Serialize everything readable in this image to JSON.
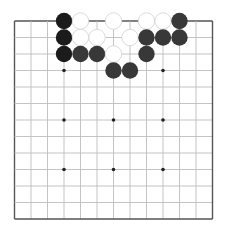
{
  "board": {
    "size": 13,
    "origin_x": 14.5,
    "origin_y": 21,
    "spacing": 16.5,
    "stone_radius": 8.2,
    "star_points": [
      [
        3,
        3
      ],
      [
        6,
        3
      ],
      [
        9,
        3
      ],
      [
        3,
        6
      ],
      [
        6,
        6
      ],
      [
        9,
        6
      ],
      [
        3,
        9
      ],
      [
        6,
        9
      ],
      [
        9,
        9
      ]
    ],
    "colors": {
      "background": "#ffffff",
      "grid_line": "#bdbdbd",
      "border_line": "#555555",
      "star_point": "#222222",
      "black_stone_dark": "#1b1b1b",
      "black_stone": "#383838",
      "white_stone_fill": "#ffffff",
      "white_stone_edge": "#d6d6d6"
    }
  },
  "stones": [
    {
      "color": "black",
      "shade": "dark",
      "col": 3,
      "row": 0
    },
    {
      "color": "black",
      "shade": "dark",
      "col": 3,
      "row": 1
    },
    {
      "color": "black",
      "shade": "dark",
      "col": 3,
      "row": 2
    },
    {
      "color": "white",
      "col": 4,
      "row": 0
    },
    {
      "color": "white",
      "col": 6,
      "row": 0
    },
    {
      "color": "white",
      "col": 8,
      "row": 0
    },
    {
      "color": "white",
      "col": 9,
      "row": 0
    },
    {
      "color": "black",
      "col": 10,
      "row": 0
    },
    {
      "color": "white",
      "col": 4,
      "row": 1
    },
    {
      "color": "white",
      "col": 5,
      "row": 1
    },
    {
      "color": "white",
      "col": 7,
      "row": 1
    },
    {
      "color": "black",
      "col": 8,
      "row": 1
    },
    {
      "color": "black",
      "col": 9,
      "row": 1
    },
    {
      "color": "black",
      "col": 10,
      "row": 1
    },
    {
      "color": "black",
      "col": 4,
      "row": 2
    },
    {
      "color": "black",
      "col": 5,
      "row": 2
    },
    {
      "color": "white",
      "col": 6,
      "row": 2
    },
    {
      "color": "black",
      "col": 8,
      "row": 2
    },
    {
      "color": "black",
      "col": 6,
      "row": 3
    },
    {
      "color": "black",
      "col": 7,
      "row": 3
    }
  ]
}
